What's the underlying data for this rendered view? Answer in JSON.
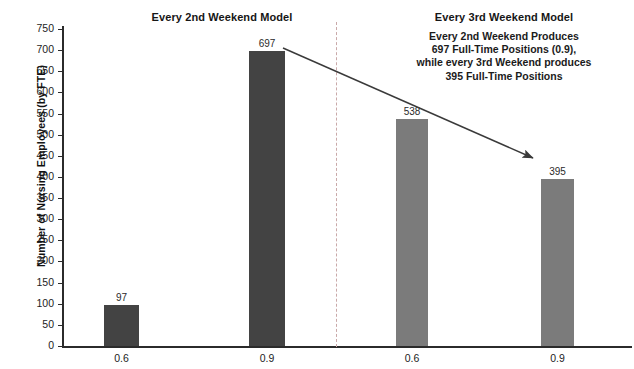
{
  "chart_data": {
    "type": "bar",
    "title": "",
    "xlabel": "",
    "ylabel": "Number of Nursing Employees (by FTE)",
    "ylim": [
      0,
      750
    ],
    "ytick_step": 50,
    "grid": false,
    "legend": "none",
    "categories": [
      "0.6",
      "0.9",
      "0.6",
      "0.9"
    ],
    "values": [
      97,
      697,
      538,
      395
    ],
    "bars": [
      {
        "category": "0.6",
        "value": 97,
        "label": "97",
        "group": "Every 2nd Weekend Model",
        "color": "#434343"
      },
      {
        "category": "0.9",
        "value": 697,
        "label": "697",
        "group": "Every 2nd Weekend Model",
        "color": "#434343"
      },
      {
        "category": "0.6",
        "value": 538,
        "label": "538",
        "group": "Every 3rd Weekend Model",
        "color": "#7b7b7b"
      },
      {
        "category": "0.9",
        "value": 395,
        "label": "395",
        "group": "Every 3rd Weekend Model",
        "color": "#7b7b7b"
      }
    ],
    "ytick_labels": [
      "0",
      "50",
      "100",
      "150",
      "200",
      "250",
      "300",
      "350",
      "400",
      "450",
      "500",
      "550",
      "600",
      "650",
      "700",
      "750"
    ],
    "groups": [
      {
        "name": "Every 2nd Weekend Model",
        "color": "#434343"
      },
      {
        "name": "Every 3rd Weekend Model",
        "color": "#7b7b7b"
      }
    ],
    "annotations": [
      {
        "name": "comparison-callout",
        "lines": [
          "Every 2nd Weekend Produces",
          "697 Full-Time Positions (0.9),",
          "while every 3rd Weekend produces",
          "395 Full-Time Positions"
        ]
      },
      {
        "name": "comparison-arrow",
        "from_bar": "697",
        "to_bar": "395"
      }
    ]
  },
  "panels": {
    "left_title": "Every 2nd Weekend Model",
    "right_title": "Every 3rd Weekend Model"
  },
  "axis": {
    "y_title": "Number of Nursing Employees (by FTE)"
  },
  "colors": {
    "bar_dark": "#434343",
    "bar_light": "#7b7b7b",
    "axis": "#2b2b2b",
    "divider": "#c9a9a9",
    "arrow": "#3a3a3a"
  }
}
